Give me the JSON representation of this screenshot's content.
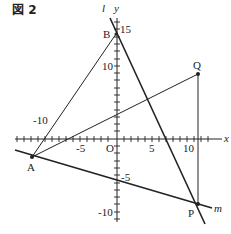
{
  "figure": {
    "title": "図 2",
    "axis_labels": {
      "x": "x",
      "y": "y"
    },
    "origin_label": "O",
    "tick_labels": {
      "x": [
        "-10",
        "-5",
        "5",
        "10"
      ],
      "y": [
        "15",
        "10",
        "5",
        "-5",
        "-10"
      ]
    },
    "line_labels": {
      "l": "l",
      "m": "m"
    },
    "points": {
      "A": {
        "label": "A",
        "x": -12,
        "y": -3
      },
      "B": {
        "label": "B",
        "x": 0,
        "y": 14
      },
      "Q": {
        "label": "Q",
        "x": 11,
        "y": 9
      },
      "P": {
        "label": "P",
        "x": 11,
        "y": -9
      }
    },
    "colors": {
      "line": "#222222",
      "background": "#ffffff"
    }
  }
}
